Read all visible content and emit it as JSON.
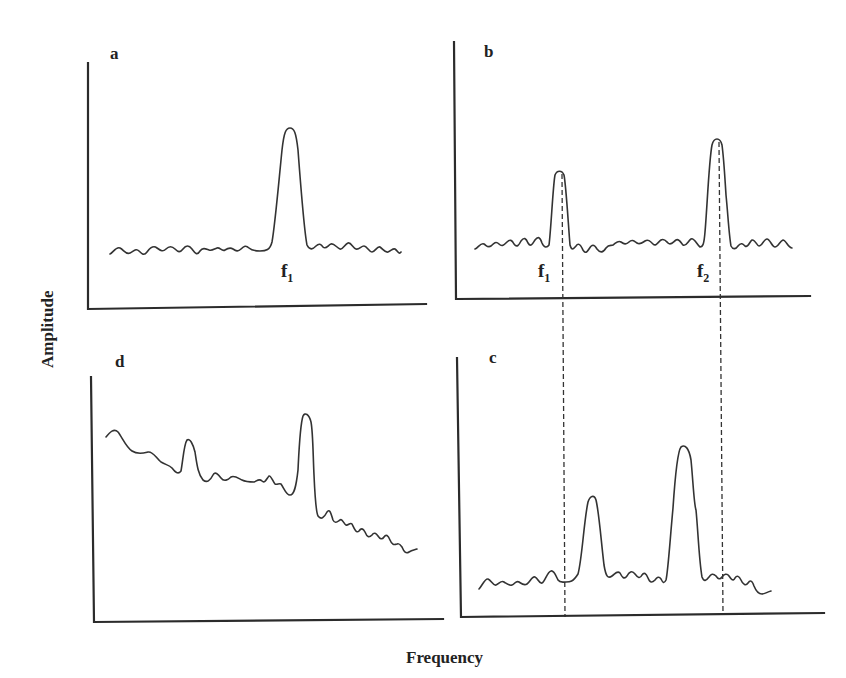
{
  "figure": {
    "x_axis_title": "Frequency",
    "y_axis_title": "Amplitude",
    "panels": [
      {
        "id": "a",
        "label": "a",
        "description": "Single sinusoid spectrum: one peak at f1 above a noisy baseline",
        "peaks": [
          {
            "label": "f",
            "subscript": "1",
            "relative_height": "high"
          }
        ]
      },
      {
        "id": "b",
        "label": "b",
        "description": "Two sinusoids: peaks at f1 (smaller) and f2 (taller) above a noisy baseline",
        "peaks": [
          {
            "label": "f",
            "subscript": "1",
            "relative_height": "medium"
          },
          {
            "label": "f",
            "subscript": "2",
            "relative_height": "high"
          }
        ]
      },
      {
        "id": "c",
        "label": "c",
        "description": "Two peaks shifted relative to the f1 and f2 dashed reference lines from panel b"
      },
      {
        "id": "d",
        "label": "d",
        "description": "Spectrum with sloping (decreasing) baseline, a small peak and a large peak"
      }
    ],
    "reference_lines": [
      {
        "name": "f1-reference",
        "style": "dashed",
        "from_panel": "b",
        "to_panel": "c"
      },
      {
        "name": "f2-reference",
        "style": "dashed",
        "from_panel": "b",
        "to_panel": "c"
      }
    ]
  }
}
